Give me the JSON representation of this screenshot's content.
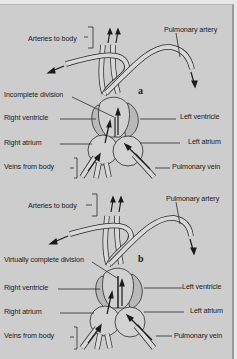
{
  "diagram": {
    "colors": {
      "background": "#cdcdcd",
      "outer": "#e9e9e9",
      "line": "#2a2a2a",
      "vessel_fill": "#d8d8d8",
      "ventricle_wall": "#b9b9b9"
    },
    "panels": [
      {
        "id": "a",
        "letter": "a",
        "labels": {
          "arteries_to_body": "Arteries to body",
          "pulmonary_artery": "Pulmonary artery",
          "division": "Incomplete division",
          "right_ventricle": "Right ventricle",
          "left_ventricle": "Left ventricle",
          "right_atrium": "Right atrium",
          "left_atrium": "Left atrium",
          "veins_from_body": "Veins from body",
          "pulmonary_vein": "Pulmonary vein"
        }
      },
      {
        "id": "b",
        "letter": "b",
        "labels": {
          "arteries_to_body": "Arteries to body",
          "pulmonary_artery": "Pulmonary artery",
          "division": "Virtually complete division",
          "right_ventricle": "Right ventricle",
          "left_ventricle": "Left ventricle",
          "right_atrium": "Right atrium",
          "left_atrium": "Left atrium",
          "veins_from_body": "Veins from body",
          "pulmonary_vein": "Pulmonary vein"
        }
      }
    ]
  }
}
